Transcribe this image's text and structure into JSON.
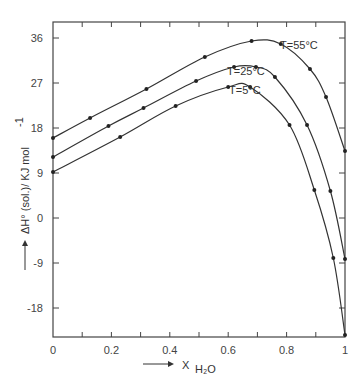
{
  "chart_data": {
    "type": "line",
    "title": "",
    "xlabel": "X H2O",
    "xlabel_main": "X",
    "xlabel_sub": "H₂O",
    "ylabel": "ΔH° (sol.)/ KJ mol⁻¹",
    "xlim": [
      0,
      1
    ],
    "ylim": [
      -23.8,
      39.2
    ],
    "grid": false,
    "legend_position": "inline labels near curves",
    "x_ticks": [
      "0",
      "0.2",
      "0.4",
      "0.6",
      "0.8",
      "1"
    ],
    "y_ticks": [
      "36",
      "27",
      "18",
      "9",
      "0",
      "-9",
      "-18"
    ],
    "series": [
      {
        "name": "T=55°C",
        "x": [
          0,
          0.127,
          0.32,
          0.52,
          0.68,
          0.78,
          0.88,
          0.935,
          1.0
        ],
        "y": [
          16.0,
          20.0,
          25.8,
          32.2,
          35.4,
          34.8,
          29.8,
          24.2,
          13.4
        ]
      },
      {
        "name": "T=25°C",
        "x": [
          0,
          0.19,
          0.31,
          0.49,
          0.62,
          0.695,
          0.76,
          0.87,
          0.95,
          1.0
        ],
        "y": [
          12.2,
          18.4,
          22.0,
          27.4,
          30.2,
          30.2,
          28.2,
          18.6,
          5.4,
          -8.2
        ]
      },
      {
        "name": "T=5°C",
        "x": [
          0,
          0.23,
          0.42,
          0.6,
          0.675,
          0.81,
          0.895,
          0.96,
          1.0
        ],
        "y": [
          9.2,
          16.2,
          22.4,
          26.2,
          26.2,
          18.6,
          5.6,
          -8.0,
          -23.4
        ]
      }
    ]
  },
  "labels": {
    "t55": "T=55°C",
    "t25": "T=25°C",
    "t5": "T=5°C",
    "ylabel": "ΔH° (sol.)/ KJ mol",
    "ylabel_sup": "-1",
    "xlabel_main": "X",
    "xlabel_sub": "H₂O"
  }
}
